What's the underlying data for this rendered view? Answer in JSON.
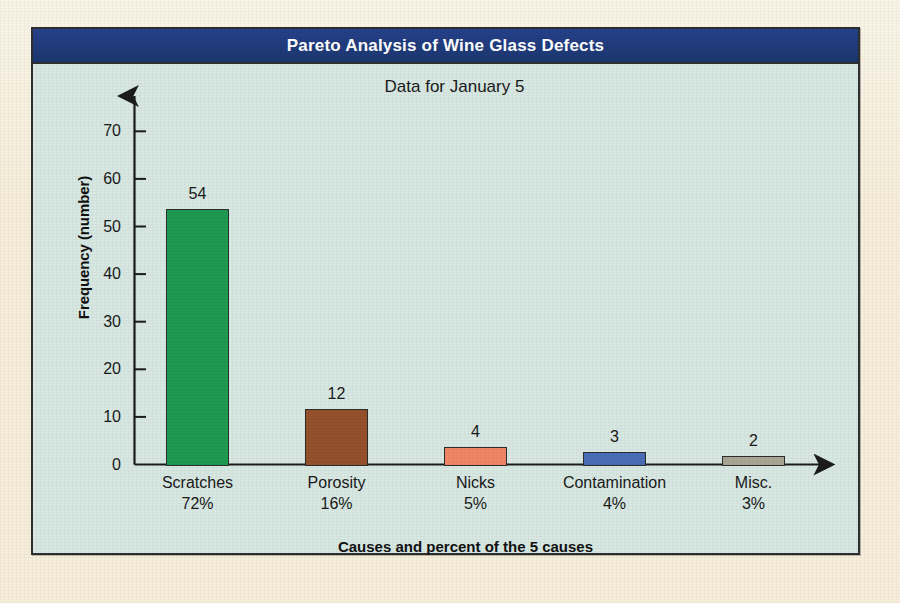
{
  "panel": {
    "title": "Pareto Analysis of Wine Glass Defects",
    "subtitle": "Data for January 5",
    "title_bar_color": "#1e3d80",
    "panel_bg_color": "#d7e7e1",
    "page_bg_color": "#f6eeda"
  },
  "chart_data": {
    "type": "bar",
    "title": "Pareto Analysis of Wine Glass Defects",
    "subtitle": "Data for January 5",
    "xlabel": "Causes and percent of the 5 causes",
    "ylabel": "Frequency (number)",
    "ylim": [
      0,
      75
    ],
    "yticks": [
      0,
      10,
      20,
      30,
      40,
      50,
      60,
      70
    ],
    "ytick_labels": [
      "0",
      "10",
      "20",
      "30",
      "40",
      "50",
      "60",
      "70"
    ],
    "grid": false,
    "legend": "none",
    "categories": [
      "Scratches",
      "Porosity",
      "Nicks",
      "Contamination",
      "Misc."
    ],
    "percents": [
      "72%",
      "16%",
      "5%",
      "4%",
      "3%"
    ],
    "values": [
      54,
      12,
      4,
      3,
      2
    ],
    "value_labels": [
      "54",
      "12",
      "4",
      "3",
      "2"
    ],
    "bar_colors": [
      "#1f9a52",
      "#94512b",
      "#f08663",
      "#4a6db5",
      "#a9a594"
    ],
    "bar_border_color": "#2c2c2c"
  }
}
